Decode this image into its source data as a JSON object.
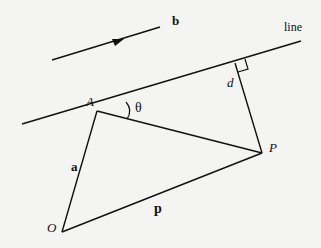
{
  "diagram": {
    "labels": {
      "b": "b",
      "line": "line",
      "d": "d",
      "A": "A",
      "theta": "θ",
      "P": "P",
      "a": "a",
      "p": "p",
      "O": "O"
    },
    "colors": {
      "stroke": "#111111",
      "background": "#f4f4f2"
    }
  }
}
